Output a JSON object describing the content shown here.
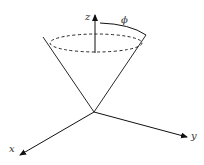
{
  "diagram": {
    "type": "cone-coordinate-system",
    "labels": {
      "z": "z",
      "y": "y",
      "x": "x",
      "phi": "ϕ"
    },
    "colors": {
      "stroke": "#111111",
      "background": "#ffffff",
      "label": "#333333"
    }
  }
}
